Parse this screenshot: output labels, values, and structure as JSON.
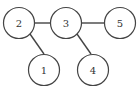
{
  "diagram": {
    "type": "tree-graph",
    "nodes": [
      {
        "id": "2",
        "label": "2",
        "cx": 19,
        "cy": 23
      },
      {
        "id": "3",
        "label": "3",
        "cx": 66,
        "cy": 23
      },
      {
        "id": "5",
        "label": "5",
        "cx": 120,
        "cy": 23
      },
      {
        "id": "1",
        "label": "1",
        "cx": 44,
        "cy": 70
      },
      {
        "id": "4",
        "label": "4",
        "cx": 93,
        "cy": 70
      }
    ],
    "edges": [
      {
        "from": "2",
        "to": "3"
      },
      {
        "from": "3",
        "to": "5"
      },
      {
        "from": "2",
        "to": "1"
      },
      {
        "from": "3",
        "to": "4"
      }
    ],
    "colors": {
      "stroke": "#444444",
      "background": "#ffffff",
      "text": "#333333"
    }
  }
}
